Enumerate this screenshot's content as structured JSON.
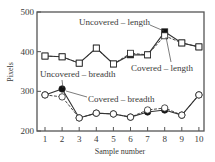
{
  "chart_data": {
    "type": "line",
    "title": "",
    "xlabel": "Sample number",
    "ylabel": "Pixels",
    "x": [
      1,
      2,
      3,
      4,
      5,
      6,
      7,
      8,
      9,
      10
    ],
    "xlim": [
      0.6,
      10.3
    ],
    "ylim": [
      200,
      500
    ],
    "yticks": [
      200,
      300,
      400,
      500
    ],
    "xticks": [
      1,
      2,
      3,
      4,
      5,
      6,
      7,
      8,
      9,
      10
    ],
    "grid": false,
    "legend": "inline annotations",
    "series": [
      {
        "name": "Uncovered – length",
        "marker": "filled-square",
        "values": [
          389,
          387,
          371,
          409,
          369,
          392,
          392,
          450,
          422,
          412
        ]
      },
      {
        "name": "Covered – length",
        "marker": "open-square",
        "values": [
          389,
          387,
          371,
          409,
          369,
          396,
          392,
          440,
          422,
          412
        ]
      },
      {
        "name": "Uncovered – breadth",
        "marker": "filled-circle",
        "values": [
          291,
          306,
          233,
          245,
          243,
          235,
          248,
          253,
          240,
          291
        ]
      },
      {
        "name": "Covered – breadth",
        "marker": "open-circle",
        "values": [
          291,
          286,
          233,
          245,
          243,
          235,
          253,
          258,
          240,
          291
        ]
      }
    ],
    "annotations": [
      {
        "text": "Uncovered – length",
        "points_to": {
          "series": "Uncovered – length",
          "x": 8
        }
      },
      {
        "text": "Covered – length",
        "points_to": {
          "series": "Covered – length",
          "x": 8
        }
      },
      {
        "text": "Uncovered – breadth",
        "points_to": {
          "series": "Uncovered – breadth",
          "x": 2
        }
      },
      {
        "text": "Covered – breadth",
        "points_to": {
          "series": "Covered – breadth",
          "x": 2
        }
      }
    ]
  },
  "labels": {
    "xlabel": "Sample number",
    "ylabel": "Pixels",
    "uncovered_length": "Uncovered – length",
    "covered_length": "Covered – length",
    "uncovered_breadth": "Uncovered – breadth",
    "covered_breadth": "Covered – breadth"
  },
  "colors": {
    "axis": "#555555",
    "line": "#333333",
    "marker_fill_dark": "#111111",
    "marker_fill_open": "#ffffff",
    "text": "#3a3a3a"
  }
}
